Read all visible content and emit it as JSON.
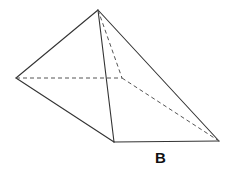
{
  "figure": {
    "type": "square pyramid (oblique), wireframe",
    "label": "B",
    "colors": {
      "background": "#ffffff",
      "stroke": "#333333",
      "hidden_stroke": "#555555"
    },
    "vertices": {
      "apex": [
        98,
        10
      ],
      "left": [
        16,
        78
      ],
      "back": [
        122,
        78
      ],
      "front": [
        114,
        142
      ],
      "right": [
        219,
        141
      ]
    },
    "edges_visible": [
      [
        "apex",
        "left"
      ],
      [
        "apex",
        "front"
      ],
      [
        "apex",
        "right"
      ],
      [
        "left",
        "front"
      ],
      [
        "front",
        "right"
      ]
    ],
    "edges_hidden": [
      [
        "apex",
        "back"
      ],
      [
        "left",
        "back"
      ],
      [
        "back",
        "right"
      ]
    ]
  }
}
